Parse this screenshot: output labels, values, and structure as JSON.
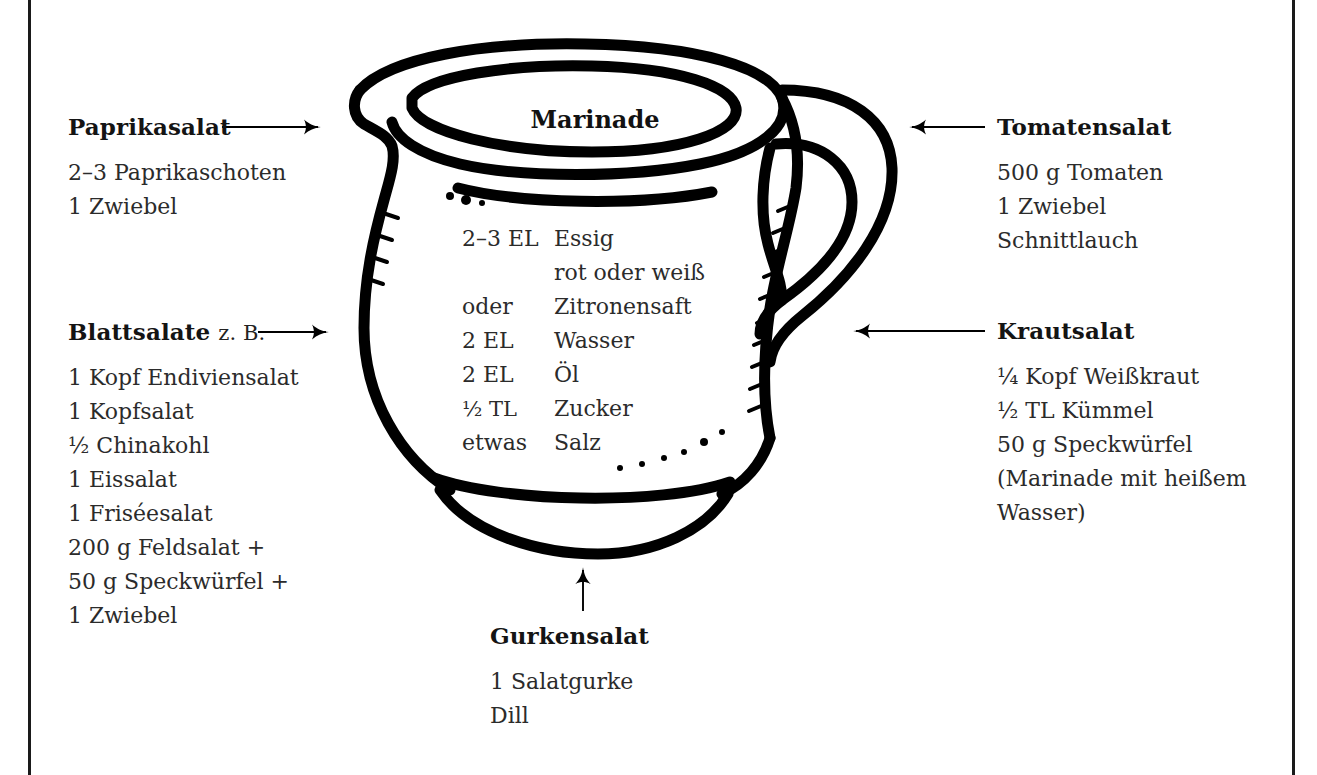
{
  "page": {
    "frame_color": "#1a1a1a",
    "background": "#ffffff",
    "ink_color": "#000000",
    "body_text_color": "#2b2b2b"
  },
  "jug": {
    "label": "Marinade",
    "icon": "pitcher-jug-illustration"
  },
  "recipe": {
    "rows": [
      {
        "qty": "2–3 EL",
        "ingredient": "Essig"
      },
      {
        "qty": "",
        "ingredient": "rot oder weiß"
      },
      {
        "qty": "oder",
        "ingredient": "Zitronensaft"
      },
      {
        "qty": "2 EL",
        "ingredient": "Wasser"
      },
      {
        "qty": "2 EL",
        "ingredient": "Öl"
      },
      {
        "qty": "½ TL",
        "ingredient": "Zucker"
      },
      {
        "qty": "etwas",
        "ingredient": "Salz"
      }
    ]
  },
  "callouts": {
    "paprika": {
      "heading": "Paprikasalat",
      "subheading": "",
      "items": [
        "2–3 Paprikaschoten",
        "1 Zwiebel"
      ],
      "arrow": "arrow-right"
    },
    "blattsalate": {
      "heading": "Blattsalate",
      "subheading": "z. B.",
      "items": [
        "1 Kopf Endiviensalat",
        "1 Kopfsalat",
        "½ Chinakohl",
        "1 Eissalat",
        "1 Friséesalat",
        "200 g Feldsalat +",
        "50 g Speckwürfel +",
        "1 Zwiebel"
      ],
      "arrow": "arrow-right"
    },
    "tomaten": {
      "heading": "Tomatensalat",
      "subheading": "",
      "items": [
        "500 g Tomaten",
        "1 Zwiebel",
        "Schnittlauch"
      ],
      "arrow": "arrow-left"
    },
    "kraut": {
      "heading": "Krautsalat",
      "subheading": "",
      "items": [
        "¼ Kopf Weißkraut",
        "½ TL Kümmel",
        "50 g Speckwürfel",
        "(Marinade mit heißem",
        "Wasser)"
      ],
      "arrow": "arrow-left"
    },
    "gurken": {
      "heading": "Gurkensalat",
      "subheading": "",
      "items": [
        "1 Salatgurke",
        "Dill"
      ],
      "arrow": "arrow-up"
    }
  }
}
